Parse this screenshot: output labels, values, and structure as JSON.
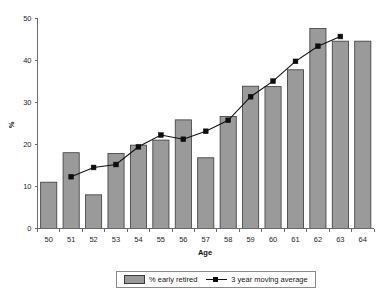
{
  "chart_data": {
    "type": "bar",
    "title": "",
    "xlabel": "Age",
    "ylabel": "%",
    "categories": [
      "50",
      "51",
      "52",
      "53",
      "54",
      "55",
      "56",
      "57",
      "58",
      "59",
      "60",
      "61",
      "62",
      "63",
      "64"
    ],
    "ylim": [
      0,
      50
    ],
    "xlim_categories": 15,
    "y_ticks": [
      "0",
      "10",
      "20",
      "30",
      "40",
      "50"
    ],
    "y_tick_values": [
      0,
      10,
      20,
      30,
      40,
      50
    ],
    "grid": false,
    "legend_position": "bottom-center",
    "series": [
      {
        "name": "% early retired",
        "type": "bar",
        "color": "#9a9a9a",
        "values": [
          11.0,
          18.0,
          8.0,
          17.8,
          19.8,
          21.0,
          25.8,
          16.8,
          26.6,
          33.8,
          33.7,
          37.7,
          47.5,
          44.5,
          44.5
        ]
      },
      {
        "name": "3 year moving average",
        "type": "line",
        "color": "#111111",
        "x": [
          "51",
          "52",
          "53",
          "54",
          "55",
          "56",
          "57",
          "58",
          "59",
          "60",
          "61",
          "62",
          "63"
        ],
        "values": [
          12.3,
          14.5,
          15.2,
          19.4,
          22.2,
          21.2,
          23.1,
          25.7,
          31.3,
          35.0,
          39.7,
          43.3,
          45.6
        ]
      }
    ]
  },
  "legend": {
    "items": [
      {
        "label": "% early retired",
        "marker": "bar-swatch"
      },
      {
        "label": "3 year moving average",
        "marker": "line-marker-swatch"
      }
    ]
  }
}
